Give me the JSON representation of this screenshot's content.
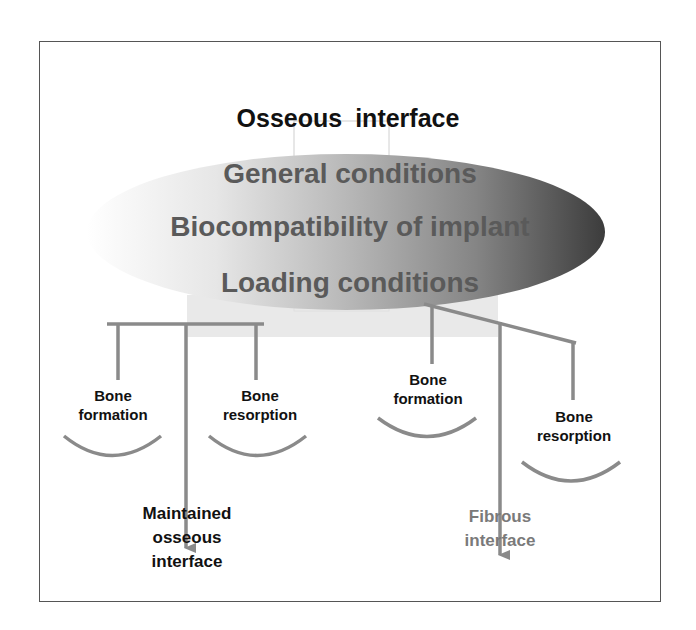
{
  "title": "Osseous  interface",
  "ellipse": {
    "lines": [
      "General conditions",
      "Biocompatibility of implant",
      "Loading conditions"
    ],
    "gradient": {
      "left": "#ffffff",
      "right": "#3c3c3c"
    },
    "text_color": "#5a5a5a"
  },
  "left_branch": {
    "formation": {
      "line1": "Bone",
      "line2": "formation"
    },
    "resorption": {
      "line1": "Bone",
      "line2": "resorption"
    },
    "outcome": {
      "line1": "Maintained",
      "line2": "osseous",
      "line3": "interface",
      "color": "#111111"
    }
  },
  "right_branch": {
    "formation": {
      "line1": "Bone",
      "line2": "formation"
    },
    "resorption": {
      "line1": "Bone",
      "line2": "resorption"
    },
    "outcome": {
      "line1": "Fibrous",
      "line2": "interface",
      "color": "#7a7a7a"
    }
  },
  "colors": {
    "connector": "#8a8a8a",
    "frame": "#555555"
  }
}
